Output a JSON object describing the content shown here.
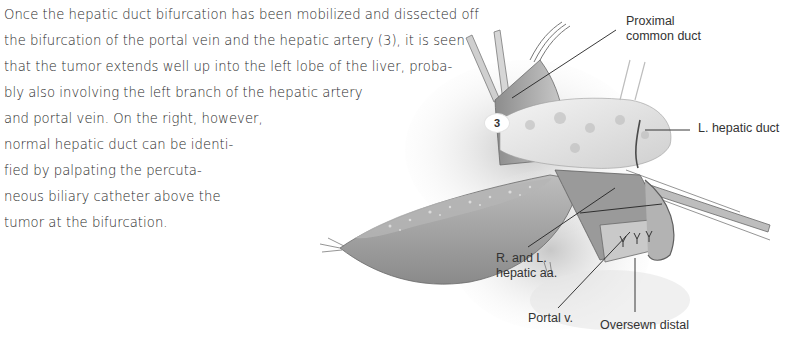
{
  "body_text": {
    "lines": [
      "Once the hepatic duct bifurcation has been mobilized and dissected off",
      "the bifurcation of the portal vein and the hepatic artery (3), it is seen",
      "that the tumor extends well up into the left lobe of the liver, proba-",
      "bly also involving the left branch of the hepatic artery",
      "and portal vein. On the right, however,",
      "normal hepatic duct can be identi-",
      "fied by palpating the percuta-",
      "neous biliary catheter above the",
      "tumor at the bifurcation."
    ]
  },
  "figure": {
    "number_marker": "3",
    "labels": {
      "proximal_common_duct_1": "Proximal",
      "proximal_common_duct_2": "common duct",
      "l_hepatic_duct": "L. hepatic duct",
      "r_and_l_hepatic_aa_1": "R. and L.",
      "r_and_l_hepatic_aa_2": "hepatic aa.",
      "portal_v": "Portal v.",
      "oversewn_distal": "Oversewn distal"
    },
    "colors": {
      "ink": "#333333",
      "tissue_light": "#d8d8d8",
      "tissue_mid": "#a9a9a9",
      "tissue_dark": "#6e6e6e"
    }
  }
}
